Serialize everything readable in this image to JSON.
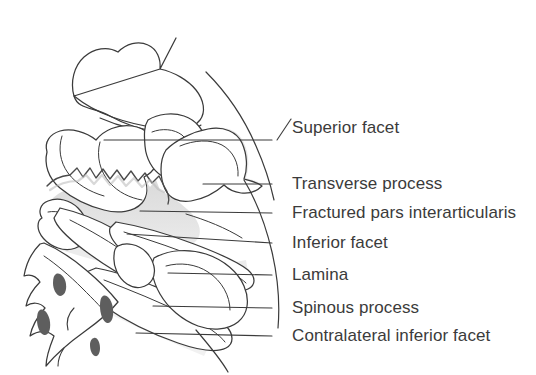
{
  "figure": {
    "kind": "anatomical-line-drawing",
    "view": "lateral view of lumbar spine with pars interarticularis fracture",
    "background_color": "#ffffff",
    "ink_color": "#3b3b3b",
    "bone_fill_color": "#ffffff",
    "shaded_fill_color": "#e2e2e2",
    "foramen_color": "#5a5a5a"
  },
  "labels": [
    {
      "id": "superior-facet",
      "text": "Superior facet",
      "text_x": 292,
      "text_y": 119,
      "leader": {
        "type": "diagonal",
        "x1": 277,
        "y1": 140,
        "x2": 291,
        "y2": 119
      }
    },
    {
      "id": "transverse-process",
      "text": "Transverse process",
      "text_x": 292,
      "text_y": 175,
      "leader": {
        "type": "dash",
        "x1": 272,
        "y1": 184,
        "x2": 289,
        "y2": 184
      }
    },
    {
      "id": "fractured-pars-interarticularis",
      "text": "Fractured pars interarticularis",
      "text_x": 292,
      "text_y": 204,
      "leader": {
        "type": "dash",
        "x1": 272,
        "y1": 213,
        "x2": 289,
        "y2": 213
      }
    },
    {
      "id": "inferior-facet",
      "text": "Inferior facet",
      "text_x": 292,
      "text_y": 234,
      "leader": {
        "type": "dash",
        "x1": 272,
        "y1": 243,
        "x2": 289,
        "y2": 243
      }
    },
    {
      "id": "lamina",
      "text": "Lamina",
      "text_x": 292,
      "text_y": 266,
      "leader": {
        "type": "dash",
        "x1": 272,
        "y1": 275,
        "x2": 289,
        "y2": 275
      }
    },
    {
      "id": "spinous-process",
      "text": "Spinous process",
      "text_x": 292,
      "text_y": 299,
      "leader": {
        "type": "dash",
        "x1": 272,
        "y1": 308,
        "x2": 289,
        "y2": 308
      }
    },
    {
      "id": "contralateral-inferior-facet",
      "text": "Contralateral inferior facet",
      "text_x": 292,
      "text_y": 327,
      "leader": {
        "type": "dash",
        "x1": 272,
        "y1": 336,
        "x2": 289,
        "y2": 336
      }
    }
  ],
  "leader_lines": [
    {
      "id": "leader-superior-facet",
      "points": "104,140 272,140"
    },
    {
      "id": "leader-transverse-process",
      "points": "203,184 272,184"
    },
    {
      "id": "leader-fractured-pars",
      "points": "140,211 272,213"
    },
    {
      "id": "leader-inferior-facet",
      "points": "127,234 272,243"
    },
    {
      "id": "leader-lamina",
      "points": "168,273 272,275"
    },
    {
      "id": "leader-spinous-process",
      "points": "153,306 272,308"
    },
    {
      "id": "leader-contralateral-inferior-facet",
      "points": "136,333 272,336"
    }
  ]
}
